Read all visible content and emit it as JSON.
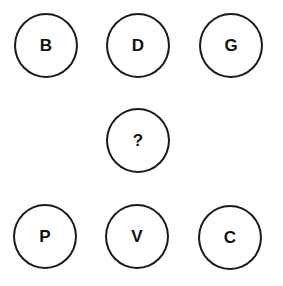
{
  "puzzle": {
    "circles": [
      {
        "label": "B",
        "cx": 47,
        "cy": 45
      },
      {
        "label": "D",
        "cx": 139,
        "cy": 45
      },
      {
        "label": "G",
        "cx": 232,
        "cy": 45
      },
      {
        "label": "?",
        "cx": 139,
        "cy": 140
      },
      {
        "label": "P",
        "cx": 46,
        "cy": 236
      },
      {
        "label": "V",
        "cx": 138,
        "cy": 236
      },
      {
        "label": "C",
        "cx": 231,
        "cy": 237
      }
    ]
  }
}
